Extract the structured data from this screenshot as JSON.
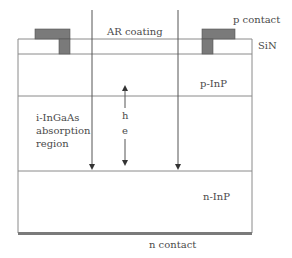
{
  "diagram": {
    "type": "photodiode-cross-section",
    "colors": {
      "line": "#8a8a8a",
      "contact_fill": "#7a7a7a",
      "text": "#4a4a4a",
      "background": "#ffffff"
    },
    "labels": {
      "ar_coating": "AR coating",
      "p_contact": "p contact",
      "sin": "SiN",
      "p_inp": "p-InP",
      "absorption_line1": "i-InGaAs",
      "absorption_line2": "absorption",
      "absorption_line3": "region",
      "hole": "h",
      "electron": "e",
      "n_inp": "n-InP",
      "n_contact": "n contact"
    },
    "layers": [
      {
        "name": "SiN",
        "top": 39,
        "bottom": 54
      },
      {
        "name": "p-InP",
        "top": 54,
        "bottom": 96
      },
      {
        "name": "i-InGaAs absorption region",
        "top": 96,
        "bottom": 171
      },
      {
        "name": "n-InP",
        "top": 171,
        "bottom": 232
      },
      {
        "name": "n contact",
        "top": 232,
        "bottom": 235
      }
    ]
  }
}
